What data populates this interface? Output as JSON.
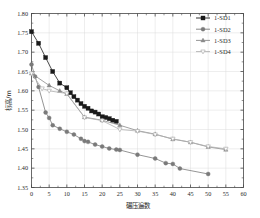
{
  "chart_data": {
    "type": "line",
    "title": "",
    "xlabel": "碾压遍数",
    "ylabel": "标高/m",
    "xlim": [
      0,
      60
    ],
    "ylim": [
      1.35,
      1.8
    ],
    "xticks": [
      "0",
      "5",
      "10",
      "15",
      "20",
      "25",
      "30",
      "35",
      "40",
      "45",
      "50",
      "55",
      "60"
    ],
    "yticks": [
      "1.35",
      "1.40",
      "1.45",
      "1.50",
      "1.55",
      "1.60",
      "1.65",
      "1.70",
      "1.75",
      "1.80"
    ],
    "xtick_step": 5,
    "ytick_step": 0.05,
    "grid": true,
    "legend_position": "top-right",
    "series": [
      {
        "name": "1-SD1",
        "marker": "filled-square",
        "color": "#1a1a1a",
        "x": [
          0,
          2,
          4,
          6,
          8,
          10,
          11,
          12,
          13,
          14,
          15,
          16,
          17,
          18,
          19,
          20,
          21,
          22,
          23,
          24
        ],
        "y": [
          1.753,
          1.723,
          1.686,
          1.65,
          1.62,
          1.608,
          1.595,
          1.585,
          1.576,
          1.567,
          1.56,
          1.555,
          1.548,
          1.545,
          1.54,
          1.533,
          1.531,
          1.528,
          1.524,
          1.521
        ]
      },
      {
        "name": "1-SD2",
        "marker": "filled-circle",
        "color": "#7a7a7a",
        "x": [
          0,
          1,
          2,
          4,
          5,
          6,
          8,
          10,
          12,
          14,
          15,
          16,
          18,
          20,
          22,
          24,
          25,
          30,
          35,
          38,
          40,
          42,
          50
        ],
        "y": [
          1.668,
          1.637,
          1.61,
          1.544,
          1.53,
          1.511,
          1.502,
          1.494,
          1.487,
          1.476,
          1.47,
          1.468,
          1.461,
          1.456,
          1.451,
          1.448,
          1.447,
          1.435,
          1.425,
          1.413,
          1.411,
          1.399,
          1.385
        ]
      },
      {
        "name": "1-SD3",
        "marker": "filled-triangle",
        "color": "#8a8a8a",
        "x": [
          0,
          5,
          8,
          10,
          15,
          20,
          25,
          30,
          35,
          40,
          45,
          50,
          55
        ],
        "y": [
          1.645,
          1.614,
          1.6,
          1.592,
          1.532,
          1.524,
          1.511,
          1.497,
          1.488,
          1.475,
          1.467,
          1.455,
          1.448
        ]
      },
      {
        "name": "1-SD4",
        "marker": "open-down-triangle",
        "color": "#b0b0b0",
        "x": [
          0,
          3,
          5,
          10,
          15,
          20,
          25,
          30,
          35,
          40,
          45,
          50,
          55
        ],
        "y": [
          1.645,
          1.606,
          1.6,
          1.593,
          1.531,
          1.523,
          1.5,
          1.496,
          1.487,
          1.476,
          1.467,
          1.456,
          1.45
        ]
      }
    ]
  },
  "legend": {
    "entries": [
      "1-SD1",
      "1-SD2",
      "1-SD3",
      "1-SD4"
    ]
  },
  "colors": {
    "axis": "#4a4a4a",
    "grid": "#dcdcdc",
    "background": "#ffffff"
  }
}
